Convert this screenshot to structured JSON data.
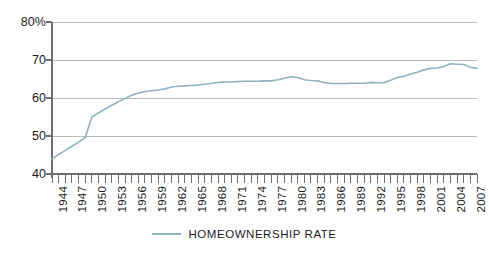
{
  "chart_data": {
    "type": "line",
    "title": "",
    "subtitle": "",
    "xlabel": "",
    "ylabel": "",
    "grid": true,
    "legend_position": "bottom",
    "ylim": [
      40,
      80
    ],
    "xlim": [
      1944,
      2008
    ],
    "y_ticks": [
      40,
      50,
      60,
      70,
      80
    ],
    "y_tick_labels": [
      "40",
      "50",
      "60",
      "70",
      "80%"
    ],
    "x_tick_labels": [
      "1944",
      "1947",
      "1950",
      "1953",
      "1956",
      "1959",
      "1962",
      "1965",
      "1968",
      "1971",
      "1974",
      "1977",
      "1980",
      "1983",
      "1986",
      "1989",
      "1992",
      "1995",
      "1998",
      "2001",
      "2004",
      "2007"
    ],
    "series": [
      {
        "name": "HOMEOWNERSHIP RATE",
        "color": "#8fb3c0",
        "x": [
          1944,
          1945,
          1946,
          1947,
          1948,
          1949,
          1950,
          1951,
          1952,
          1953,
          1954,
          1955,
          1956,
          1957,
          1958,
          1959,
          1960,
          1961,
          1962,
          1963,
          1964,
          1965,
          1966,
          1967,
          1968,
          1969,
          1970,
          1971,
          1972,
          1973,
          1974,
          1975,
          1976,
          1977,
          1978,
          1979,
          1980,
          1981,
          1982,
          1983,
          1984,
          1985,
          1986,
          1987,
          1988,
          1989,
          1990,
          1991,
          1992,
          1993,
          1994,
          1995,
          1996,
          1997,
          1998,
          1999,
          2000,
          2001,
          2002,
          2003,
          2004,
          2005,
          2006,
          2007,
          2008
        ],
        "values": [
          44.0,
          45.1,
          46.2,
          47.3,
          48.4,
          49.6,
          55.0,
          56.1,
          57.1,
          58.1,
          59.0,
          59.9,
          60.7,
          61.3,
          61.7,
          61.9,
          62.1,
          62.4,
          62.9,
          63.1,
          63.2,
          63.3,
          63.4,
          63.6,
          63.9,
          64.1,
          64.2,
          64.2,
          64.3,
          64.4,
          64.4,
          64.4,
          64.5,
          64.5,
          64.8,
          65.2,
          65.6,
          65.4,
          64.8,
          64.6,
          64.5,
          64.1,
          63.8,
          63.8,
          63.8,
          63.9,
          63.9,
          63.9,
          64.1,
          64.0,
          64.0,
          64.7,
          65.4,
          65.7,
          66.3,
          66.8,
          67.4,
          67.8,
          67.9,
          68.3,
          69.0,
          68.9,
          68.8,
          68.1,
          67.8
        ]
      }
    ],
    "legend": [
      {
        "label": "HOMEOWNERSHIP RATE",
        "color": "#8fb3c0"
      }
    ]
  },
  "geometry": {
    "plot_left": 52,
    "plot_right": 477,
    "plot_top": 22,
    "plot_bottom": 174,
    "tick_step_years": 1,
    "label_step_years": 3
  },
  "colors": {
    "line": "#8fb3c0",
    "grid": "#b9b9b9",
    "axis": "#6e6e6e",
    "text": "#1b1b1b",
    "background": "#ffffff"
  }
}
